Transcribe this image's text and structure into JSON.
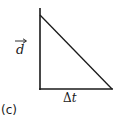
{
  "diagram": {
    "type": "right-triangle graph",
    "panel_label": "(c)",
    "vertical_axis_label": {
      "symbol": "d",
      "vector_arrow": true
    },
    "horizontal_axis_label": {
      "delta": "Δ",
      "symbol": "t"
    },
    "line_color": "#1a1a1a",
    "shapes": {
      "vertical_axis": {
        "x": 40,
        "y1": 8,
        "y2": 90
      },
      "horizontal_axis": {
        "x1": 40,
        "x2": 113,
        "y": 89
      },
      "diagonal": {
        "x1": 40,
        "y1": 15,
        "x2": 112,
        "y2": 89
      }
    }
  }
}
